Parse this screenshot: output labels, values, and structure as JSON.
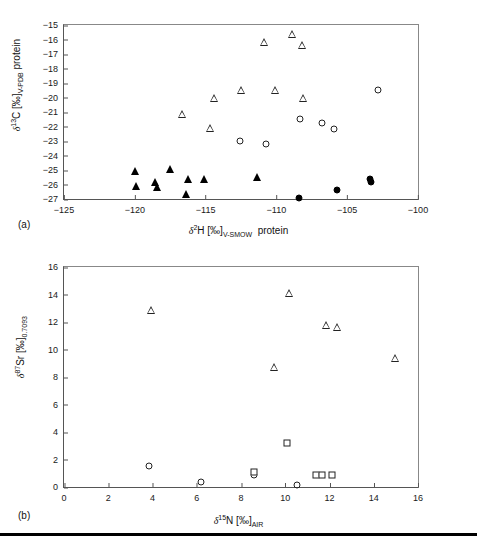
{
  "figure": {
    "footer_rule": "horizontal-rule"
  },
  "panel_a": {
    "tag": "(a)",
    "chart_data": {
      "type": "scatter",
      "title": "",
      "xlabel": "δ²H [‰]V-SMOW protein",
      "ylabel": "δ¹³C [‰]V-PDB protein",
      "xlabel_parts": {
        "delta": "δ",
        "sup": "2",
        "element": "H [‰]",
        "sub": "V-SMOW",
        "suffix": " protein"
      },
      "ylabel_parts": {
        "delta": "δ",
        "sup": "13",
        "element": "C [‰]",
        "sub": "V-PDB",
        "suffix": " protein"
      },
      "xlim": [
        -125,
        -100
      ],
      "ylim": [
        -27,
        -15
      ],
      "xticks": [
        -125,
        -120,
        -115,
        -110,
        -105,
        -100
      ],
      "yticks": [
        -15,
        -16,
        -17,
        -18,
        -19,
        -20,
        -21,
        -22,
        -23,
        -24,
        -25,
        -26,
        -27
      ],
      "grid": false,
      "legend": "none",
      "series": [
        {
          "name": "open-triangle",
          "marker": "open-triangle",
          "points": [
            [
              -116.7,
              -21.15
            ],
            [
              -114.4,
              -20.05
            ],
            [
              -114.7,
              -22.1
            ],
            [
              -112.5,
              -19.45
            ],
            [
              -110.9,
              -16.15
            ],
            [
              -110.1,
              -19.5
            ],
            [
              -108.9,
              -15.65
            ],
            [
              -108.2,
              -16.35
            ],
            [
              -108.1,
              -20.05
            ]
          ]
        },
        {
          "name": "open-circle",
          "marker": "open-circle",
          "points": [
            [
              -112.6,
              -23.0
            ],
            [
              -110.7,
              -23.2
            ],
            [
              -108.3,
              -21.5
            ],
            [
              -106.8,
              -21.75
            ],
            [
              -105.9,
              -22.2
            ],
            [
              -102.8,
              -19.5
            ]
          ]
        },
        {
          "name": "filled-triangle",
          "marker": "filled-triangle",
          "points": [
            [
              -120.0,
              -25.1
            ],
            [
              -119.95,
              -26.1
            ],
            [
              -118.6,
              -25.85
            ],
            [
              -118.45,
              -26.2
            ],
            [
              -117.5,
              -24.9
            ],
            [
              -116.35,
              -26.65
            ],
            [
              -116.25,
              -25.65
            ],
            [
              -115.1,
              -25.65
            ],
            [
              -111.4,
              -25.5
            ]
          ]
        },
        {
          "name": "filled-circle",
          "marker": "filled-circle",
          "points": [
            [
              -108.4,
              -26.95
            ],
            [
              -105.75,
              -26.4
            ],
            [
              -103.4,
              -25.65
            ],
            [
              -103.35,
              -25.85
            ]
          ]
        }
      ]
    }
  },
  "panel_b": {
    "tag": "(b)",
    "chart_data": {
      "type": "scatter",
      "title": "",
      "xlabel": "δ¹⁵N [‰]AIR",
      "ylabel": "δ⁸⁷Sr [‰]0.7093",
      "xlabel_parts": {
        "delta": "δ",
        "sup": "15",
        "element": "N [‰]",
        "sub": "AIR",
        "suffix": ""
      },
      "ylabel_parts": {
        "delta": "δ",
        "sup": "87",
        "element": "Sr [‰]",
        "sub": "0.7093",
        "suffix": ""
      },
      "xlim": [
        0,
        16
      ],
      "ylim": [
        0,
        16
      ],
      "xticks": [
        0,
        2,
        4,
        6,
        8,
        10,
        12,
        14,
        16
      ],
      "yticks": [
        0,
        2,
        4,
        6,
        8,
        10,
        12,
        14,
        16
      ],
      "grid": false,
      "legend": "none",
      "series": [
        {
          "name": "open-triangle",
          "marker": "open-triangle",
          "points": [
            [
              3.95,
              12.85
            ],
            [
              9.5,
              8.75
            ],
            [
              10.15,
              14.1
            ],
            [
              11.85,
              11.8
            ],
            [
              12.35,
              11.65
            ],
            [
              14.95,
              9.35
            ]
          ]
        },
        {
          "name": "open-circle",
          "marker": "open-circle",
          "points": [
            [
              3.85,
              1.5
            ],
            [
              6.2,
              0.35
            ],
            [
              8.6,
              0.85
            ],
            [
              10.55,
              0.15
            ]
          ]
        },
        {
          "name": "open-square",
          "marker": "open-square",
          "points": [
            [
              8.6,
              1.1
            ],
            [
              10.1,
              3.2
            ],
            [
              11.4,
              0.9
            ],
            [
              11.65,
              0.9
            ],
            [
              12.1,
              0.9
            ]
          ]
        }
      ]
    }
  }
}
